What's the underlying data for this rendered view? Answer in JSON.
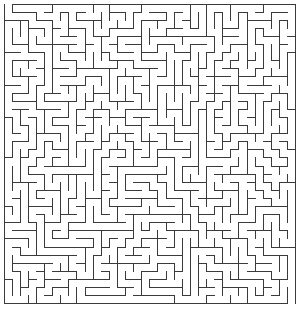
{
  "maze": {
    "cols": 36,
    "rows": 37,
    "cell_size": 8.1,
    "origin_x": 4,
    "origin_y": 4,
    "wall_color": "#3a3a3a",
    "background_color": "#ffffff",
    "wall_width": 1,
    "seed": 1337,
    "entrance": {
      "side": "top",
      "col": 0
    },
    "exit": {
      "side": "bottom",
      "col": 35
    }
  }
}
